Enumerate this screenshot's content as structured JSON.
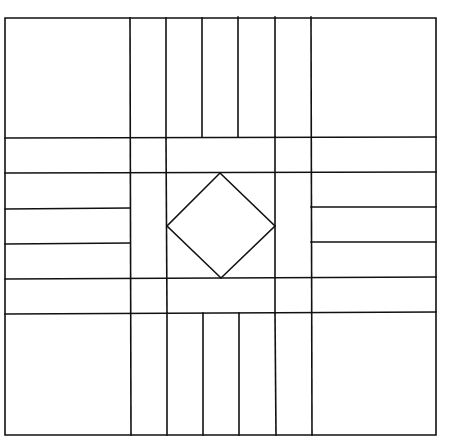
{
  "diagram": {
    "title": "",
    "stroke_color": "#111111",
    "background": "#ffffff",
    "outer": {
      "x1": 5,
      "y1": 18,
      "x2": 436,
      "y2": 435
    },
    "diamond": {
      "top": [
        220,
        173
      ],
      "right": [
        275,
        226
      ],
      "bottom": [
        221,
        278
      ],
      "left": [
        167,
        226
      ]
    },
    "lines": [
      {
        "id": "v-130",
        "x1": 130,
        "y1": 18,
        "x2": 131,
        "y2": 435
      },
      {
        "id": "v-311",
        "x1": 311,
        "y1": 17,
        "x2": 312,
        "y2": 435
      },
      {
        "id": "v-166-top",
        "x1": 166,
        "y1": 18,
        "x2": 166,
        "y2": 138
      },
      {
        "id": "v-202-top",
        "x1": 202,
        "y1": 18,
        "x2": 202,
        "y2": 137
      },
      {
        "id": "v-238-top",
        "x1": 238,
        "y1": 17,
        "x2": 238,
        "y2": 137
      },
      {
        "id": "v-275-top",
        "x1": 275,
        "y1": 17,
        "x2": 275,
        "y2": 137
      },
      {
        "id": "v-166-mid",
        "x1": 166,
        "y1": 138,
        "x2": 167,
        "y2": 313
      },
      {
        "id": "v-275-mid",
        "x1": 275,
        "y1": 137,
        "x2": 275,
        "y2": 313
      },
      {
        "id": "v-167-bot",
        "x1": 167,
        "y1": 313,
        "x2": 167,
        "y2": 435
      },
      {
        "id": "v-203-bot",
        "x1": 203,
        "y1": 313,
        "x2": 203,
        "y2": 435
      },
      {
        "id": "v-239-bot",
        "x1": 239,
        "y1": 313,
        "x2": 239,
        "y2": 435
      },
      {
        "id": "v-275-bot",
        "x1": 275,
        "y1": 313,
        "x2": 276,
        "y2": 435
      },
      {
        "id": "h-138",
        "x1": 5,
        "y1": 138,
        "x2": 436,
        "y2": 137
      },
      {
        "id": "h-173",
        "x1": 5,
        "y1": 173,
        "x2": 436,
        "y2": 172
      },
      {
        "id": "h-279",
        "x1": 5,
        "y1": 279,
        "x2": 436,
        "y2": 277
      },
      {
        "id": "h-314",
        "x1": 5,
        "y1": 314,
        "x2": 436,
        "y2": 312
      },
      {
        "id": "h-209-left",
        "x1": 5,
        "y1": 209,
        "x2": 130,
        "y2": 208
      },
      {
        "id": "h-244-left",
        "x1": 5,
        "y1": 244,
        "x2": 130,
        "y2": 243
      },
      {
        "id": "h-207-right",
        "x1": 311,
        "y1": 207,
        "x2": 436,
        "y2": 207
      },
      {
        "id": "h-242-right",
        "x1": 311,
        "y1": 242,
        "x2": 436,
        "y2": 242
      }
    ]
  }
}
